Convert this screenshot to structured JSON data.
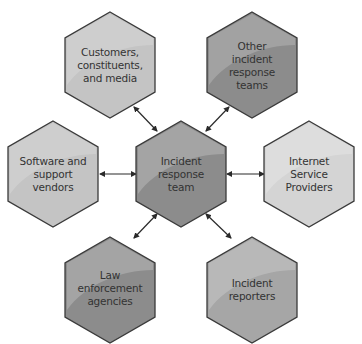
{
  "diagram": {
    "center": {
      "label": "Incident\nresponse\nteam",
      "tone": "dark"
    },
    "nodes": [
      {
        "id": "customers",
        "label": "Customers,\nconstituents,\nand media",
        "tone": "light"
      },
      {
        "id": "other-teams",
        "label": "Other\nincident\nresponse\nteams",
        "tone": "dark"
      },
      {
        "id": "software-vendors",
        "label": "Software and\nsupport\nvendors",
        "tone": "light"
      },
      {
        "id": "isp",
        "label": "Internet\nService\nProviders",
        "tone": "lighter"
      },
      {
        "id": "law-enforcement",
        "label": "Law\nenforcement\nagencies",
        "tone": "dark"
      },
      {
        "id": "incident-reporters",
        "label": "Incident\nreporters",
        "tone": "medium"
      }
    ],
    "connections": [
      {
        "from": "incident-response-team",
        "to": "customers",
        "type": "bidirectional"
      },
      {
        "from": "incident-response-team",
        "to": "other-teams",
        "type": "bidirectional"
      },
      {
        "from": "incident-response-team",
        "to": "software-vendors",
        "type": "bidirectional"
      },
      {
        "from": "incident-response-team",
        "to": "isp",
        "type": "bidirectional"
      },
      {
        "from": "incident-response-team",
        "to": "law-enforcement",
        "type": "bidirectional"
      },
      {
        "from": "incident-response-team",
        "to": "incident-reporters",
        "type": "bidirectional"
      }
    ],
    "colors": {
      "dark": "#8c8c8c",
      "dark_highlight": "#a8a8a8",
      "medium": "#a6a6a6",
      "medium_highlight": "#bdbdbd",
      "light": "#c4c4c4",
      "light_highlight": "#d6d6d6",
      "lighter": "#d4d4d4",
      "lighter_highlight": "#e2e2e2",
      "stroke": "#3a3a3a",
      "arrow": "#2a2a2a",
      "text": "#333333"
    }
  }
}
